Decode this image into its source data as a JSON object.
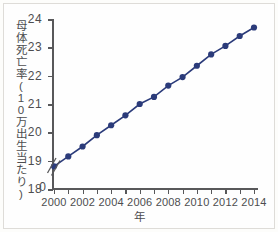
{
  "chart_data": {
    "type": "line",
    "title": "",
    "xlabel": "年",
    "ylabel": "母体死亡率(10万出生当たり)",
    "x": [
      2000,
      2001,
      2002,
      2003,
      2004,
      2005,
      2006,
      2007,
      2008,
      2009,
      2010,
      2011,
      2012,
      2013,
      2014
    ],
    "values": [
      18.8,
      19.15,
      19.5,
      19.9,
      20.25,
      20.6,
      21.0,
      21.25,
      21.65,
      21.95,
      22.35,
      22.75,
      23.05,
      23.4,
      23.7
    ],
    "series": [
      {
        "name": "母体死亡率",
        "values": [
          18.8,
          19.15,
          19.5,
          19.9,
          20.25,
          20.6,
          21.0,
          21.25,
          21.65,
          21.95,
          22.35,
          22.75,
          23.05,
          23.4,
          23.7
        ]
      }
    ],
    "ylim": [
      18,
      24
    ],
    "xlim": [
      2000,
      2014
    ],
    "y_ticks": [
      18,
      19,
      20,
      21,
      22,
      23,
      24
    ],
    "y_tick_labels": [
      "18",
      "19",
      "20",
      "21",
      "22",
      "23",
      "24"
    ],
    "y_origin_label": "0",
    "y_axis_break": true,
    "x_ticks": [
      2000,
      2001,
      2002,
      2003,
      2004,
      2005,
      2006,
      2007,
      2008,
      2009,
      2010,
      2011,
      2012,
      2013,
      2014
    ],
    "x_tick_labels": [
      "2000",
      "",
      "2002",
      "",
      "2004",
      "",
      "2006",
      "",
      "2008",
      "",
      "2010",
      "",
      "2012",
      "",
      "2014"
    ],
    "grid": false,
    "legend": null,
    "marker": "circle",
    "marker_color": "#2b3b7a",
    "line_color": "#2b3b7a"
  },
  "figure": {
    "background_color": "#fefefe",
    "border_color": "#dedcd8",
    "axis_color": "#58585a",
    "text_color": "#4d4d4f"
  }
}
